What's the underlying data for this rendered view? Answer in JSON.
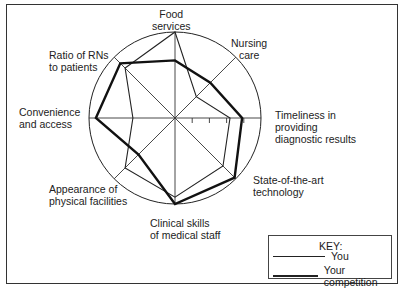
{
  "chart_data": {
    "type": "radar",
    "title": "",
    "axes": [
      "Food services",
      "Nursing care",
      "Timeliness in providing diagnostic results",
      "State-of-the-art technology",
      "Clinical skills of medical staff",
      "Appearance of physical facilities",
      "Convenience and access",
      "Ratio of RNs to patients"
    ],
    "range": [
      0,
      1
    ],
    "grid": "single outer circle with 8 radial spokes; 4 tick marks on the Timeliness axis",
    "series": [
      {
        "name": "You",
        "style": "thin",
        "values": [
          1.0,
          0.35,
          0.64,
          0.79,
          0.92,
          0.82,
          0.49,
          0.82
        ]
      },
      {
        "name": "Your competition",
        "style": "thick",
        "values": [
          0.67,
          0.58,
          0.78,
          0.98,
          1.0,
          0.6,
          0.92,
          0.9
        ]
      }
    ],
    "legend_position": "bottom-right"
  },
  "labels": {
    "food": [
      "Food",
      "services"
    ],
    "nursing": [
      "Nursing",
      "care"
    ],
    "timeliness": [
      "Timeliness in",
      "providing",
      "diagnostic results"
    ],
    "tech": [
      "State-of-the-art",
      "technology"
    ],
    "clinical": [
      "Clinical skills",
      "of medical staff"
    ],
    "appearance": [
      "Appearance of",
      "physical facilities"
    ],
    "convenience": [
      "Convenience",
      "and access"
    ],
    "ratio": [
      "Ratio of RNs",
      "to patients"
    ]
  },
  "key": {
    "title": "KEY:",
    "you": "You",
    "competition": "Your competition"
  }
}
